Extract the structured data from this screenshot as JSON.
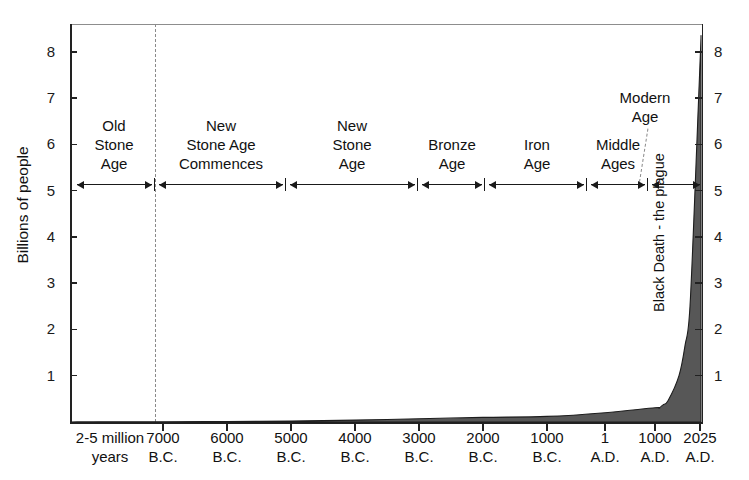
{
  "chart_data": {
    "type": "area",
    "title": "World population over the course of history",
    "ylabel": "Billions of people",
    "xlabel": "",
    "ylim": [
      0,
      8.6
    ],
    "yticks": [
      1,
      2,
      3,
      4,
      5,
      6,
      7,
      8
    ],
    "ytick_labels_left": [
      "8",
      "7",
      "6",
      "5",
      "4",
      "3",
      "2",
      "1"
    ],
    "ytick_labels_right": [
      "8",
      "7",
      "6",
      "5",
      "4",
      "3",
      "2",
      "1"
    ],
    "grid": false,
    "legend": "none",
    "xtick_labels": [
      {
        "line1": "2-5 million",
        "line2": "years"
      },
      {
        "line1": "7000",
        "line2": "B.C."
      },
      {
        "line1": "6000",
        "line2": "B.C."
      },
      {
        "line1": "5000",
        "line2": "B.C."
      },
      {
        "line1": "4000",
        "line2": "B.C."
      },
      {
        "line1": "3000",
        "line2": "B.C."
      },
      {
        "line1": "2000",
        "line2": "B.C."
      },
      {
        "line1": "1000",
        "line2": "B.C."
      },
      {
        "line1": "1",
        "line2": "A.D."
      },
      {
        "line1": "1000",
        "line2": "A.D."
      },
      {
        "line1": "2025",
        "line2": "A.D."
      }
    ],
    "series": [
      {
        "name": "World population",
        "x": [
          "2-5 million years",
          "7000 B.C.",
          "6000 B.C.",
          "5000 B.C.",
          "4000 B.C.",
          "3000 B.C.",
          "2000 B.C.",
          "1000 B.C.",
          "1 A.D.",
          "1000 A.D.",
          "1350 A.D.",
          "1500 A.D.",
          "1800 A.D.",
          "1900 A.D.",
          "1950 A.D.",
          "2000 A.D.",
          "2025 A.D."
        ],
        "values": [
          0.003,
          0.007,
          0.01,
          0.02,
          0.04,
          0.07,
          0.1,
          0.12,
          0.2,
          0.31,
          0.37,
          0.46,
          1.0,
          1.65,
          2.5,
          6.1,
          8.3
        ]
      }
    ],
    "annotations": [
      {
        "name": "black-death",
        "text": "Black Death - the plague",
        "orientation": "vertical"
      }
    ],
    "eras": [
      {
        "label_lines": [
          "Old",
          "Stone",
          "Age"
        ],
        "start": "2-5 million years",
        "end": "7000 B.C."
      },
      {
        "label_lines": [
          "New",
          "Stone Age",
          "Commences"
        ],
        "start": "7000 B.C.",
        "end": "5500 B.C."
      },
      {
        "label_lines": [
          "New",
          "Stone",
          "Age"
        ],
        "start": "5500 B.C.",
        "end": "3000 B.C."
      },
      {
        "label_lines": [
          "Bronze",
          "Age"
        ],
        "start": "3000 B.C.",
        "end": "2000 B.C."
      },
      {
        "label_lines": [
          "Iron",
          "Age"
        ],
        "start": "2000 B.C.",
        "end": "1 A.D."
      },
      {
        "label_lines": [
          "Middle",
          "Ages"
        ],
        "start": "1 A.D.",
        "end": "1500 A.D."
      },
      {
        "label_lines": [
          "Modern",
          "Age"
        ],
        "start": "1500 A.D.",
        "end": "2025 A.D."
      }
    ]
  }
}
